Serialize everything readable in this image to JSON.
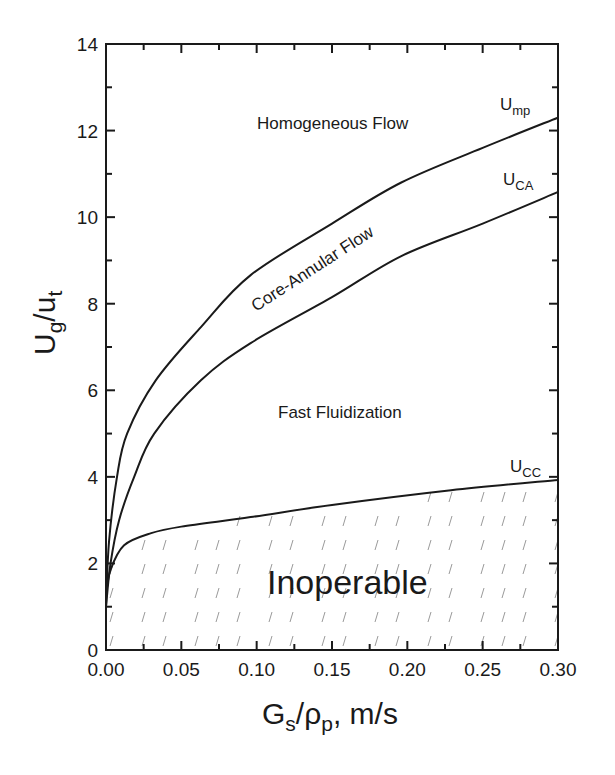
{
  "chart_data": {
    "type": "line",
    "title": "",
    "xlabel": "Gs/ρp, m/s",
    "ylabel": "Ug/ut",
    "xlim": [
      0,
      0.3
    ],
    "ylim": [
      0,
      14
    ],
    "x_ticks": [
      "0.00",
      "0.05",
      "0.10",
      "0.15",
      "0.20",
      "0.25",
      "0.30"
    ],
    "y_ticks": [
      "0",
      "2",
      "4",
      "6",
      "8",
      "10",
      "12",
      "14"
    ],
    "grid": false,
    "legend": "none (curves labeled inline)",
    "series": [
      {
        "name": "Ump",
        "label_main": "U",
        "label_sub": "mp",
        "x": [
          0,
          0.002,
          0.0073,
          0.014,
          0.033,
          0.063,
          0.096,
          0.15,
          0.196,
          0.25,
          0.3
        ],
        "y": [
          1.0,
          2.5,
          4.0,
          5.0,
          6.23,
          7.46,
          8.66,
          9.85,
          10.8,
          11.6,
          12.3
        ]
      },
      {
        "name": "UCA",
        "label_main": "U",
        "label_sub": "CA",
        "x": [
          0,
          0.003,
          0.0087,
          0.0187,
          0.032,
          0.063,
          0.096,
          0.15,
          0.196,
          0.25,
          0.3
        ],
        "y": [
          1.0,
          2.0,
          3.0,
          4.0,
          5.0,
          6.23,
          7.09,
          8.15,
          9.1,
          9.85,
          10.58
        ]
      },
      {
        "name": "UCC",
        "label_main": "U",
        "label_sub": "CC",
        "x": [
          0,
          0.003,
          0.012,
          0.03,
          0.05,
          0.096,
          0.15,
          0.229,
          0.3
        ],
        "y": [
          1.27,
          1.85,
          2.42,
          2.7,
          2.85,
          3.07,
          3.35,
          3.69,
          3.93
        ]
      }
    ],
    "annotations": [
      {
        "text": "Homogeneous Flow",
        "region": "above Ump"
      },
      {
        "text": "Core-Annular Flow",
        "region": "between Ump and UCA",
        "rotated": true
      },
      {
        "text": "Fast Fluidization",
        "region": "between UCA and UCC"
      },
      {
        "text": "Inoperable",
        "region": "below UCC (hatched)"
      }
    ]
  },
  "labels": {
    "x_title_main": "G",
    "x_title_sub1": "s",
    "x_title_mid": "/ρ",
    "x_title_sub2": "p",
    "x_title_tail": ", m/s",
    "y_title_main": "U",
    "y_title_sub1": "g",
    "y_title_mid": "/u",
    "y_title_sub2": "t",
    "homogeneous": "Homogeneous Flow",
    "core_annular": "Core-Annular Flow",
    "fast": "Fast Fluidization",
    "inoperable": "Inoperable"
  }
}
